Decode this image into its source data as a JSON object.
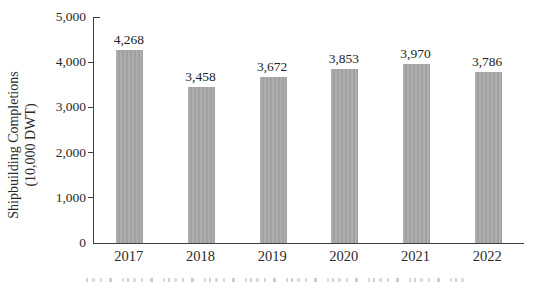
{
  "figure": {
    "ylabel_line1": "Shipbuilding Completions",
    "ylabel_line2": "(10,000 DWT)"
  },
  "chart_data": {
    "type": "bar",
    "title": "",
    "xlabel": "",
    "ylabel": "Shipbuilding Completions (10,000 DWT)",
    "categories": [
      "2017",
      "2018",
      "2019",
      "2020",
      "2021",
      "2022"
    ],
    "values": [
      4268,
      3458,
      3672,
      3853,
      3970,
      3786
    ],
    "bar_labels": [
      "4,268",
      "3,458",
      "3,672",
      "3,853",
      "3,970",
      "3,786"
    ],
    "ylim": [
      0,
      5000
    ],
    "ytick_values": [
      0,
      1000,
      2000,
      3000,
      4000,
      5000
    ],
    "ytick_labels": [
      "0",
      "1,000",
      "2,000",
      "3,000",
      "4,000",
      "5,000"
    ],
    "grid": false,
    "legend": "none",
    "colors": {
      "bar": "#a9a9a9",
      "axis": "#3f3f3f",
      "text": "#262626",
      "background": "#ffffff"
    }
  }
}
